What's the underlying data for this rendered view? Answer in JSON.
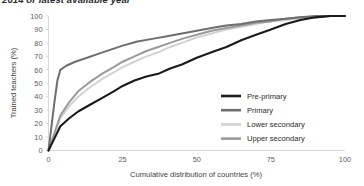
{
  "title": "2014 or latest available year",
  "axes": {
    "y_label": "Trained teachers (%)",
    "x_label": "Cumulative distribution of countries (%)",
    "y_ticks": [
      "0",
      "10",
      "20",
      "30",
      "40",
      "50",
      "60",
      "70",
      "80",
      "90",
      "100"
    ],
    "x_ticks": [
      "0",
      "25",
      "50",
      "75",
      "100"
    ]
  },
  "legend": {
    "items": [
      {
        "label": "Pre-primary",
        "color": "#1a1a1a"
      },
      {
        "label": "Primary",
        "color": "#6e6e6e"
      },
      {
        "label": "Lower secondary",
        "color": "#d2d2d2"
      },
      {
        "label": "Upper secondary",
        "color": "#9a9a9a"
      }
    ]
  },
  "chart_data": {
    "type": "line",
    "title": "2014 or latest available year",
    "xlabel": "Cumulative distribution of countries (%)",
    "ylabel": "Trained teachers (%)",
    "xlim": [
      0,
      100
    ],
    "ylim": [
      0,
      100
    ],
    "grid": false,
    "legend_position": "center-right",
    "series": [
      {
        "name": "Pre-primary",
        "color": "#1a1a1a",
        "x": [
          0,
          2,
          4,
          7,
          10,
          14,
          18,
          22,
          25,
          29,
          33,
          37,
          41,
          45,
          50,
          55,
          60,
          65,
          70,
          75,
          80,
          85,
          90,
          95,
          100
        ],
        "y": [
          0,
          9,
          18,
          24,
          29,
          34,
          39,
          44,
          48,
          52,
          55,
          57,
          61,
          64,
          69,
          73,
          77,
          82,
          86,
          90,
          94,
          97,
          99,
          100,
          100
        ]
      },
      {
        "name": "Primary",
        "color": "#6e6e6e",
        "x": [
          0,
          1,
          2,
          3,
          4,
          6,
          9,
          13,
          17,
          21,
          25,
          30,
          35,
          40,
          45,
          50,
          55,
          60,
          65,
          70,
          75,
          80,
          85,
          90,
          95,
          100
        ],
        "y": [
          0,
          18,
          36,
          52,
          60,
          63,
          66,
          69,
          72,
          75,
          78,
          81,
          83,
          85,
          87,
          89,
          91,
          93,
          94,
          96,
          97,
          98,
          99,
          100,
          100,
          100
        ]
      },
      {
        "name": "Lower secondary",
        "color": "#d2d2d2",
        "x": [
          0,
          2,
          4,
          7,
          10,
          14,
          18,
          22,
          25,
          29,
          33,
          37,
          41,
          45,
          50,
          55,
          60,
          65,
          70,
          75,
          80,
          85,
          90,
          95,
          100
        ],
        "y": [
          0,
          12,
          24,
          33,
          40,
          47,
          53,
          58,
          62,
          66,
          70,
          73,
          77,
          80,
          84,
          87,
          90,
          92,
          94,
          96,
          97,
          98,
          99,
          100,
          100
        ]
      },
      {
        "name": "Upper secondary",
        "color": "#9a9a9a",
        "x": [
          0,
          2,
          4,
          7,
          10,
          14,
          18,
          22,
          25,
          29,
          33,
          37,
          41,
          45,
          50,
          55,
          60,
          65,
          70,
          75,
          80,
          85,
          90,
          95,
          100
        ],
        "y": [
          0,
          13,
          26,
          36,
          44,
          51,
          57,
          62,
          66,
          70,
          74,
          77,
          80,
          83,
          86,
          89,
          91,
          93,
          95,
          96,
          98,
          99,
          99,
          100,
          100
        ]
      }
    ]
  }
}
